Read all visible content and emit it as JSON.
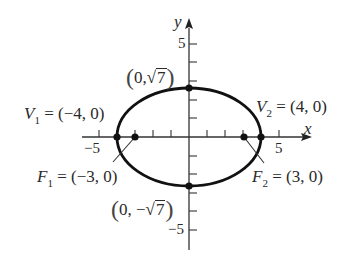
{
  "figure": {
    "type": "ellipse-diagram",
    "equation_params": {
      "a": 4,
      "b_squared": 7,
      "c": 3
    },
    "axes": {
      "x_label": "x",
      "y_label": "y",
      "x_tick_labels": {
        "neg": "−5",
        "pos": "5"
      },
      "y_tick_labels": {
        "pos": "5",
        "neg": "−5"
      },
      "x_range": [
        -6,
        6
      ],
      "y_range": [
        -6,
        6
      ],
      "tick_step": 1
    },
    "points": {
      "v1": {
        "name": "V",
        "sub": "1",
        "eq": "=",
        "coords": "(−4, 0)",
        "x": -4,
        "y": 0
      },
      "v2": {
        "name": "V",
        "sub": "2",
        "eq": "=",
        "coords": "(4, 0)",
        "x": 4,
        "y": 0
      },
      "f1": {
        "name": "F",
        "sub": "1",
        "eq": "=",
        "coords": "(−3, 0)",
        "x": -3,
        "y": 0
      },
      "f2": {
        "name": "F",
        "sub": "2",
        "eq": "=",
        "coords": "(3, 0)",
        "x": 3,
        "y": 0
      },
      "top": {
        "open": "(",
        "prefix": "0,",
        "radical_sign": "√",
        "radicand": "7",
        "close": ")",
        "x": 0,
        "y": 2.6458
      },
      "bottom": {
        "open": "(",
        "prefix": "0, −",
        "radical_sign": "√",
        "radicand": "7",
        "close": ")",
        "x": 0,
        "y": -2.6458
      }
    },
    "colors": {
      "curve": "#111111",
      "axis": "#333333",
      "text": "#2a2a2a",
      "background": "#ffffff"
    }
  }
}
